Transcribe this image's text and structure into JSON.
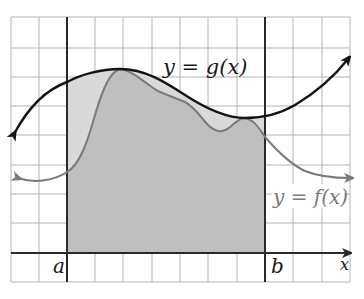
{
  "diagram": {
    "grid": {
      "x_lines": [
        11,
        39,
        67,
        95,
        123,
        152,
        180,
        208,
        237,
        265,
        293,
        322,
        350
      ],
      "y_lines": [
        17,
        48,
        77,
        106,
        135,
        165,
        194,
        223,
        253,
        282
      ],
      "color": "#b3b3b3"
    },
    "axes": {
      "x_axis_label": "x",
      "a_label": "a",
      "b_label": "b"
    },
    "curves": {
      "g": {
        "label": "y = g(x)",
        "color": "#141414"
      },
      "f": {
        "label": "y = f(x)",
        "color": "#7a7a7a"
      }
    },
    "shading": {
      "between_curves": "#d9d9d9",
      "under_f": "#bfbfbf"
    }
  }
}
